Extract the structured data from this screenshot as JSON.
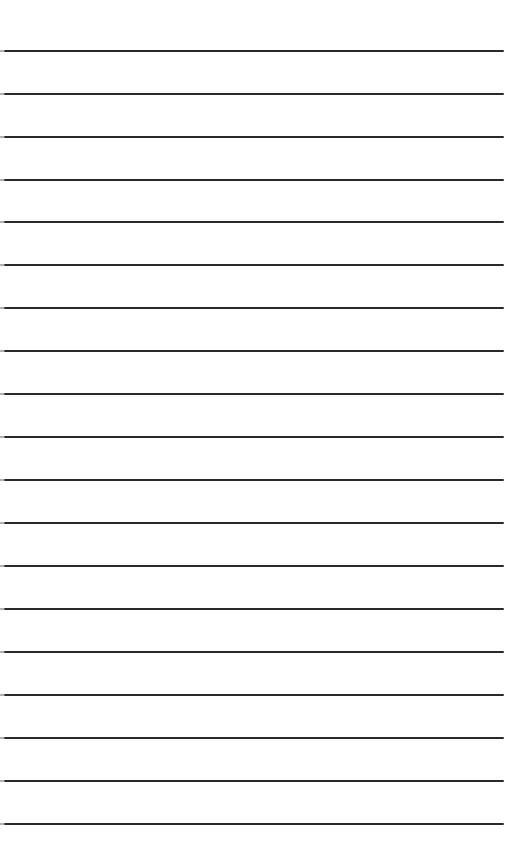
{
  "paper": {
    "type": "lined-paper",
    "background_color": "#ffffff",
    "line_color": "#2a2a2a",
    "line_count": 19,
    "line_positions_y": [
      51,
      94,
      137,
      180,
      222,
      265,
      308,
      351,
      394,
      437,
      480,
      523,
      566,
      609,
      652,
      695,
      738,
      781,
      824
    ]
  }
}
